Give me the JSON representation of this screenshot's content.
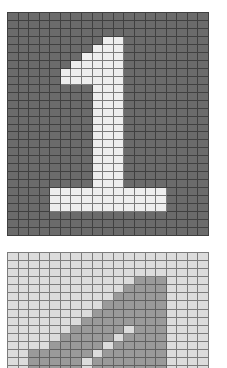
{
  "panels": [
    {
      "id": "top",
      "label": "digit-1-light-on-dark",
      "cols": 19,
      "rows": 28,
      "background_color": "#6b6b6b",
      "foreground_color": "#eeeeee",
      "on_cells": {
        "3": [
          9,
          10
        ],
        "4": [
          8,
          9,
          10
        ],
        "5": [
          7,
          8,
          9,
          10
        ],
        "6": [
          6,
          7,
          8,
          9,
          10
        ],
        "7": [
          5,
          6,
          7,
          8,
          9,
          10
        ],
        "8": [
          5,
          6,
          7,
          8,
          9,
          10
        ],
        "9": [
          8,
          9,
          10
        ],
        "10": [
          8,
          9,
          10
        ],
        "11": [
          8,
          9,
          10
        ],
        "12": [
          8,
          9,
          10
        ],
        "13": [
          8,
          9,
          10
        ],
        "14": [
          8,
          9,
          10
        ],
        "15": [
          8,
          9,
          10
        ],
        "16": [
          8,
          9,
          10
        ],
        "17": [
          8,
          9,
          10
        ],
        "18": [
          8,
          9,
          10
        ],
        "19": [
          8,
          9,
          10
        ],
        "20": [
          8,
          9,
          10
        ],
        "21": [
          8,
          9,
          10
        ],
        "22": [
          4,
          5,
          6,
          7,
          8,
          9,
          10,
          11,
          12,
          13,
          14
        ],
        "23": [
          4,
          5,
          6,
          7,
          8,
          9,
          10,
          11,
          12,
          13,
          14
        ],
        "24": [
          4,
          5,
          6,
          7,
          8,
          9,
          10,
          11,
          12,
          13,
          14
        ]
      }
    },
    {
      "id": "bottom",
      "label": "slanted-stroke-dark-on-light",
      "cols": 19,
      "rows": 15,
      "background_color": "#dcdcdc",
      "foreground_color": "#9a9a9a",
      "on_cells": {
        "3": [
          12,
          13,
          14
        ],
        "4": [
          11,
          12,
          13,
          14
        ],
        "5": [
          10,
          11,
          12,
          13,
          14
        ],
        "6": [
          9,
          10,
          11,
          12,
          13,
          14
        ],
        "7": [
          8,
          9,
          10,
          11,
          12,
          13,
          14
        ],
        "8": [
          7,
          8,
          9,
          10,
          11,
          12,
          13,
          14
        ],
        "9": [
          6,
          7,
          8,
          9,
          10,
          12,
          13,
          14
        ],
        "10": [
          5,
          6,
          7,
          8,
          9,
          11,
          12,
          13,
          14
        ],
        "11": [
          4,
          5,
          6,
          7,
          8,
          10,
          11,
          12,
          13,
          14
        ],
        "12": [
          2,
          3,
          4,
          5,
          6,
          7,
          9,
          10,
          11,
          12,
          13,
          14
        ],
        "13": [
          2,
          3,
          4,
          5,
          6,
          8,
          9,
          10,
          11,
          12,
          13,
          14
        ],
        "14": [
          2,
          3,
          4,
          5,
          6,
          8,
          9,
          10,
          11,
          12,
          13,
          14
        ]
      }
    }
  ]
}
